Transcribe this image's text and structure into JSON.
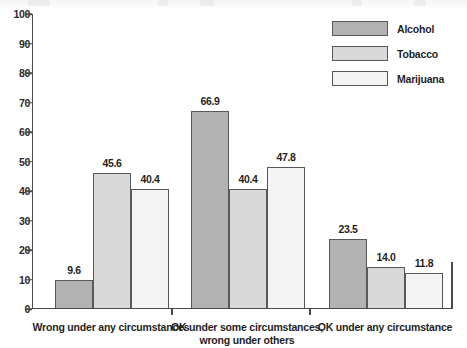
{
  "chart_data": {
    "type": "bar",
    "title": "",
    "xlabel": "",
    "ylabel": "",
    "ylim": [
      0,
      100
    ],
    "ytick_step": 10,
    "ytick_labels": [
      "0",
      "10",
      "20",
      "30",
      "40",
      "50",
      "60",
      "70",
      "80",
      "90",
      "100"
    ],
    "grid": false,
    "legend_position": "top-right",
    "categories": [
      "Wrong under any circumstances",
      "OK under some circumstances, wrong under others",
      "OK under any circumstance"
    ],
    "category_lines": [
      [
        "Wrong under any circumstances"
      ],
      [
        "OK under some circumstances,",
        "wrong under others"
      ],
      [
        "OK under any circumstance"
      ]
    ],
    "series": [
      {
        "name": "Alcohol",
        "color": "#b2b2b2",
        "values": [
          9.6,
          66.9,
          23.5
        ],
        "labels": [
          "9.6",
          "66.9",
          "23.5"
        ]
      },
      {
        "name": "Tobacco",
        "color": "#d9d9d9",
        "values": [
          45.6,
          40.4,
          14.0
        ],
        "labels": [
          "45.6",
          "40.4",
          "14.0"
        ]
      },
      {
        "name": "Marijuana",
        "color": "#f4f4f4",
        "values": [
          40.4,
          47.8,
          11.8
        ],
        "labels": [
          "40.4",
          "47.8",
          "11.8"
        ]
      }
    ]
  },
  "legend": {
    "items": [
      {
        "label": "Alcohol",
        "swatch": "alcohol-swatch"
      },
      {
        "label": "Tobacco",
        "swatch": "tobacco-swatch"
      },
      {
        "label": "Marijuana",
        "swatch": "marijuana-swatch"
      }
    ]
  },
  "axis": {
    "y_labels": [
      "100",
      "90",
      "80",
      "70",
      "60",
      "50",
      "40",
      "30",
      "20",
      "10",
      "0"
    ]
  }
}
